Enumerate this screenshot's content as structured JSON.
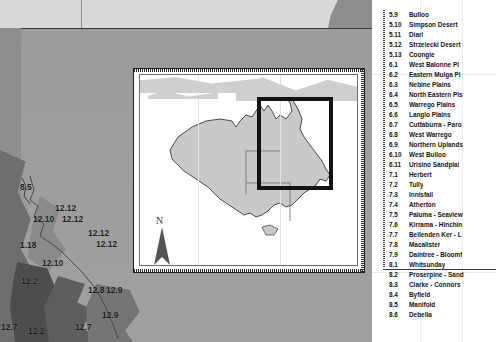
{
  "document": {
    "type": "gis-map-figure",
    "description": "Grayscale base map of eastern Australia with numbered bioregion labels, an Australia locator inset map with a highlight rectangle over Queensland, and a numbered bioregion legend."
  },
  "colors": {
    "base_map": "#9d9d9d",
    "top_band": "#d9d9d9",
    "left_strip": "#8f8f8f",
    "sea": "#6e6e6e",
    "dark_region": "#4d4d4d",
    "inset_background": "#ffffff",
    "inset_border": "#1f1f1f",
    "highlight_box": "#121212",
    "legend_text": "#141414",
    "inset_cloud": "#cfcfcf"
  },
  "basemap": {
    "labels": [
      {
        "text": "8.5",
        "x": 20,
        "y": 182
      },
      {
        "text": "12.12",
        "x": 55,
        "y": 203
      },
      {
        "text": "12.10",
        "x": 33,
        "y": 214
      },
      {
        "text": "12.12",
        "x": 62,
        "y": 214
      },
      {
        "text": "12.12",
        "x": 88,
        "y": 228
      },
      {
        "text": "12.12",
        "x": 96,
        "y": 239
      },
      {
        "text": "1.18",
        "x": 20,
        "y": 240
      },
      {
        "text": "12.10",
        "x": 42,
        "y": 258
      },
      {
        "text": "12.8",
        "x": 88,
        "y": 285
      },
      {
        "text": "12.9",
        "x": 106,
        "y": 285
      },
      {
        "text": "12.9",
        "x": 102,
        "y": 310
      },
      {
        "text": "12.2",
        "x": 21,
        "y": 276
      },
      {
        "text": "12.7",
        "x": 1,
        "y": 322
      },
      {
        "text": "12.2",
        "x": 28,
        "y": 326
      },
      {
        "text": "12.7",
        "x": 75,
        "y": 322
      }
    ]
  },
  "inset_map": {
    "name": "australia-locator-map",
    "north_arrow_label": "N",
    "highlight_region": "Queensland study area"
  },
  "legend": {
    "name": "bioregion-legend",
    "items": [
      {
        "code": "5.9",
        "label": "Bulloo"
      },
      {
        "code": "5.10",
        "label": "Simpson Desert"
      },
      {
        "code": "5.11",
        "label": "Diari"
      },
      {
        "code": "5.12",
        "label": "Strzelecki Desert"
      },
      {
        "code": "5.13",
        "label": "Coongie"
      },
      {
        "code": "6.1",
        "label": "West Balonne Pl"
      },
      {
        "code": "6.2",
        "label": "Eastern Mulga Pl"
      },
      {
        "code": "6.3",
        "label": "Nebine Plains"
      },
      {
        "code": "6.4",
        "label": "North Eastern Pls"
      },
      {
        "code": "6.5",
        "label": "Warrego Plains"
      },
      {
        "code": "6.6",
        "label": "Langlo Plains"
      },
      {
        "code": "6.7",
        "label": "Cuttaburra - Paro"
      },
      {
        "code": "6.8",
        "label": "West Warrego"
      },
      {
        "code": "6.9",
        "label": "Northern Uplands"
      },
      {
        "code": "6.10",
        "label": "West Bulloo"
      },
      {
        "code": "6.11",
        "label": "Urisino Sandplai"
      },
      {
        "code": "7.1",
        "label": "Herbert"
      },
      {
        "code": "7.2",
        "label": "Tully"
      },
      {
        "code": "7.3",
        "label": "Innisfail"
      },
      {
        "code": "7.4",
        "label": "Atherton"
      },
      {
        "code": "7.5",
        "label": "Paluma - Seaview"
      },
      {
        "code": "7.6",
        "label": "Kirrama - Hinchin"
      },
      {
        "code": "7.7",
        "label": "Bellenden Ker - L"
      },
      {
        "code": "7.8",
        "label": "Macalister"
      },
      {
        "code": "7.9",
        "label": "Daintree - Bloomf"
      },
      {
        "code": "8.1",
        "label": "Whitsunday"
      },
      {
        "code": "8.2",
        "label": "Proserpine - Sand"
      },
      {
        "code": "8.3",
        "label": "Clarke - Connors"
      },
      {
        "code": "8.4",
        "label": "Byfield"
      },
      {
        "code": "8.5",
        "label": "Manifold"
      },
      {
        "code": "8.6",
        "label": "Debella"
      }
    ]
  }
}
